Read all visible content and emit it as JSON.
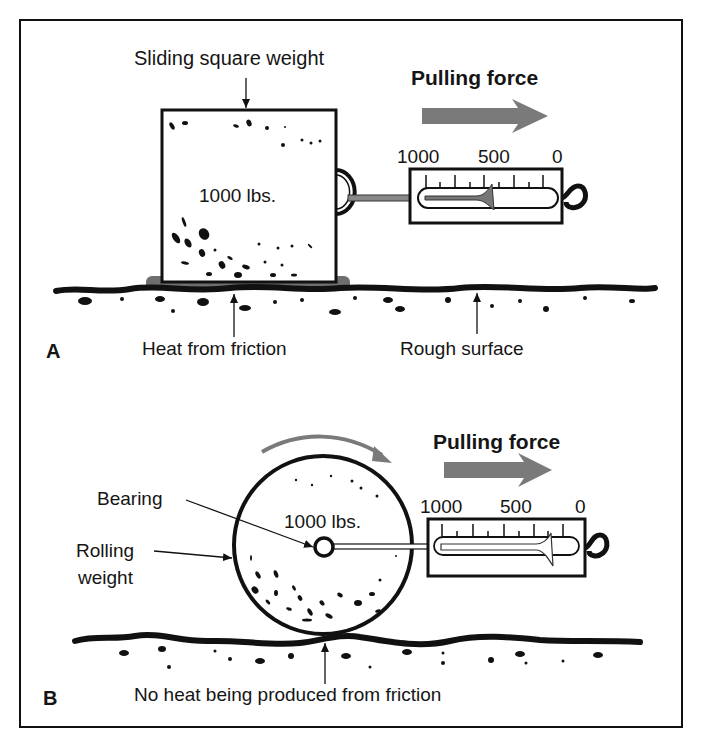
{
  "panel_a": {
    "letter": "A",
    "weight_title": "Sliding square weight",
    "weight_value": "1000 lbs.",
    "force_label": "Pulling force",
    "scale_ticks": {
      "left": "1000",
      "middle": "500",
      "right": "0"
    },
    "scale_reading": 450,
    "heat_label": "Heat from friction",
    "surface_label": "Rough surface"
  },
  "panel_b": {
    "letter": "B",
    "bearing_label": "Bearing",
    "weight_label_line1": "Rolling",
    "weight_label_line2": "weight",
    "weight_value": "1000 lbs.",
    "force_label": "Pulling force",
    "scale_ticks": {
      "left": "1000",
      "middle": "500",
      "right": "0"
    },
    "scale_reading": 50,
    "no_heat_label": "No heat being produced from friction"
  },
  "colors": {
    "ink": "#111111",
    "arrow_gray": "#7a7a7a",
    "heat_gray": "#6e6e6e",
    "background": "#ffffff"
  }
}
